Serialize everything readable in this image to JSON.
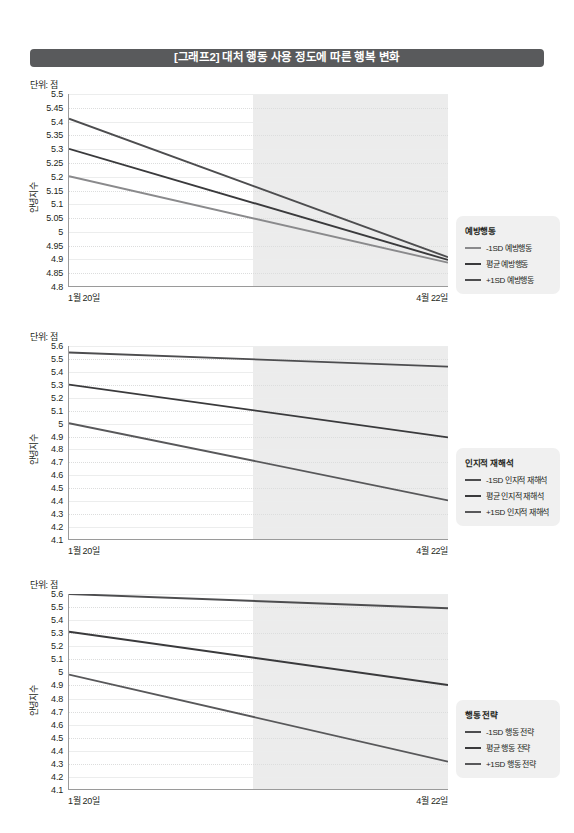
{
  "header": {
    "title": "[그래프2] 대처 행동 사용 정도에 따른 행복 변화",
    "bar_color": "#595a5c"
  },
  "common": {
    "unit_label": "단위: 점",
    "yaxis_title": "안녕지수",
    "x_start_label": "1월 20일",
    "x_end_label": "4월 22일",
    "shade_color": "#e9e9e9",
    "line_colors": {
      "minus1sd": "#8a8a8c",
      "mean": "#3a3a3c",
      "plus1sd": "#4d4d4f"
    }
  },
  "chart_data": [
    {
      "id": "chart-1",
      "type": "line",
      "title": "예방행동",
      "xlabel": "",
      "ylabel": "안녕지수",
      "unit": "단위: 점",
      "x": [
        "1월 20일",
        "4월 22일"
      ],
      "xtick_labels": [
        "1월 20일",
        "4월 22일"
      ],
      "ylim": [
        4.8,
        5.5
      ],
      "ytick_step": 0.05,
      "ytick_labels": [
        "5.5",
        "5.45",
        "5.4",
        "5.35",
        "5.3",
        "5.25",
        "5.2",
        "5.15",
        "5.1",
        "5.05",
        "5",
        "4.95",
        "4.9",
        "4.85",
        "4.8"
      ],
      "grid": true,
      "legend_position": "right",
      "shaded_from_fraction": 0.485,
      "series": [
        {
          "name": "-1SD 예방행동",
          "values": [
            5.2,
            4.885
          ],
          "color": "#8a8a8c"
        },
        {
          "name": "평균 예방행동",
          "values": [
            5.3,
            4.895
          ],
          "color": "#3a3a3c"
        },
        {
          "name": "+1SD 예방행동",
          "values": [
            5.41,
            4.905
          ],
          "color": "#4d4d4f"
        }
      ]
    },
    {
      "id": "chart-2",
      "type": "line",
      "title": "인지적 재해석",
      "xlabel": "",
      "ylabel": "안녕지수",
      "unit": "단위: 점",
      "x": [
        "1월 20일",
        "4월 22일"
      ],
      "xtick_labels": [
        "1월 20일",
        "4월 22일"
      ],
      "ylim": [
        4.1,
        5.6
      ],
      "ytick_step": 0.1,
      "ytick_labels": [
        "5.6",
        "5.5",
        "5.4",
        "5.3",
        "5.2",
        "5.1",
        "5",
        "4.9",
        "4.8",
        "4.7",
        "4.6",
        "4.5",
        "4.4",
        "4.3",
        "4.2",
        "4.1"
      ],
      "grid": true,
      "legend_position": "right",
      "shaded_from_fraction": 0.485,
      "series": [
        {
          "name": "-1SD 인지적 재해석",
          "values": [
            5.55,
            5.44
          ],
          "color": "#4d4d4f"
        },
        {
          "name": "평균 인지적 재해석",
          "values": [
            5.3,
            4.89
          ],
          "color": "#3a3a3c"
        },
        {
          "name": "+1SD 인지적 재해석",
          "values": [
            5.0,
            4.4
          ],
          "color": "#58585a"
        }
      ]
    },
    {
      "id": "chart-3",
      "type": "line",
      "title": "행동 전략",
      "xlabel": "",
      "ylabel": "안녕지수",
      "unit": "단위: 점",
      "x": [
        "1월 20일",
        "4월 22일"
      ],
      "xtick_labels": [
        "1월 20일",
        "4월 22일"
      ],
      "ylim": [
        4.1,
        5.6
      ],
      "ytick_step": 0.1,
      "ytick_labels": [
        "5.6",
        "5.5",
        "5.4",
        "5.3",
        "5.2",
        "5.1",
        "5",
        "4.9",
        "4.8",
        "4.7",
        "4.6",
        "4.5",
        "4.4",
        "4.3",
        "4.2",
        "4.1"
      ],
      "grid": true,
      "legend_position": "right",
      "shaded_from_fraction": 0.485,
      "series": [
        {
          "name": "-1SD 행동 전략",
          "values": [
            5.6,
            5.49
          ],
          "color": "#4d4d4f"
        },
        {
          "name": "평균 행동 전략",
          "values": [
            5.31,
            4.9
          ],
          "color": "#3a3a3c"
        },
        {
          "name": "+1SD 행동 전략",
          "values": [
            4.98,
            4.31
          ],
          "color": "#58585a"
        }
      ]
    }
  ]
}
